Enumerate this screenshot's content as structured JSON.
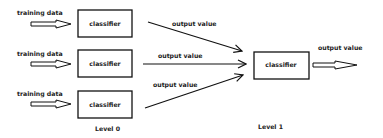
{
  "diagram": {
    "type": "stacking-ensemble",
    "colors": {
      "line": "#111111",
      "text": "#222222",
      "background": "#ffffff",
      "hollow_arrow_fill": "#ffffff"
    },
    "level0": {
      "label": "Level 0",
      "rows": [
        {
          "input_label": "training data",
          "classifier_label": "classifier",
          "output_label": "output value"
        },
        {
          "input_label": "training data",
          "classifier_label": "classifier",
          "output_label": "output value"
        },
        {
          "input_label": "training data",
          "classifier_label": "classifier",
          "output_label": "output value"
        }
      ]
    },
    "level1": {
      "label": "Level 1",
      "classifier_label": "classifier",
      "output_label": "output value"
    }
  }
}
